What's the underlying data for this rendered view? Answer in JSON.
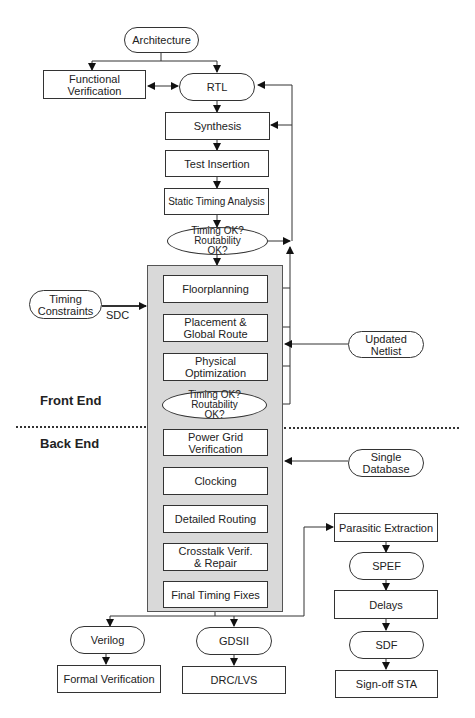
{
  "diagram": {
    "type": "design-flow",
    "nodes": {
      "architecture": "Architecture",
      "functional_verification": "Functional Verification",
      "rtl": "RTL",
      "synthesis": "Synthesis",
      "test_insertion": "Test Insertion",
      "sta": "Static Timing Analysis",
      "check1": "Timing OK? Routability OK?",
      "timing_constraints": "Timing Constraints",
      "floorplanning": "Floorplanning",
      "placement": "Placement & Global Route",
      "physical_optimization": "Physical Optimization",
      "updated_netlist": "Updated Netlist",
      "check2": "Timing OK? Routability OK?",
      "power_grid": "Power Grid Verification",
      "clocking": "Clocking",
      "single_database": "Single Database",
      "detailed_routing": "Detailed Routing",
      "crosstalk": "Crosstalk Verif. & Repair",
      "final_timing": "Final Timing Fixes",
      "parasitic_extraction": "Parasitic Extraction",
      "spef": "SPEF",
      "delays": "Delays",
      "sdf": "SDF",
      "signoff_sta": "Sign-off STA",
      "verilog": "Verilog",
      "formal_verification": "Formal Verification",
      "gdsii": "GDSII",
      "drc_lvs": "DRC/LVS"
    },
    "edge_labels": {
      "sdc": "SDC"
    },
    "sections": {
      "front_end": "Front End",
      "back_end": "Back End"
    }
  }
}
